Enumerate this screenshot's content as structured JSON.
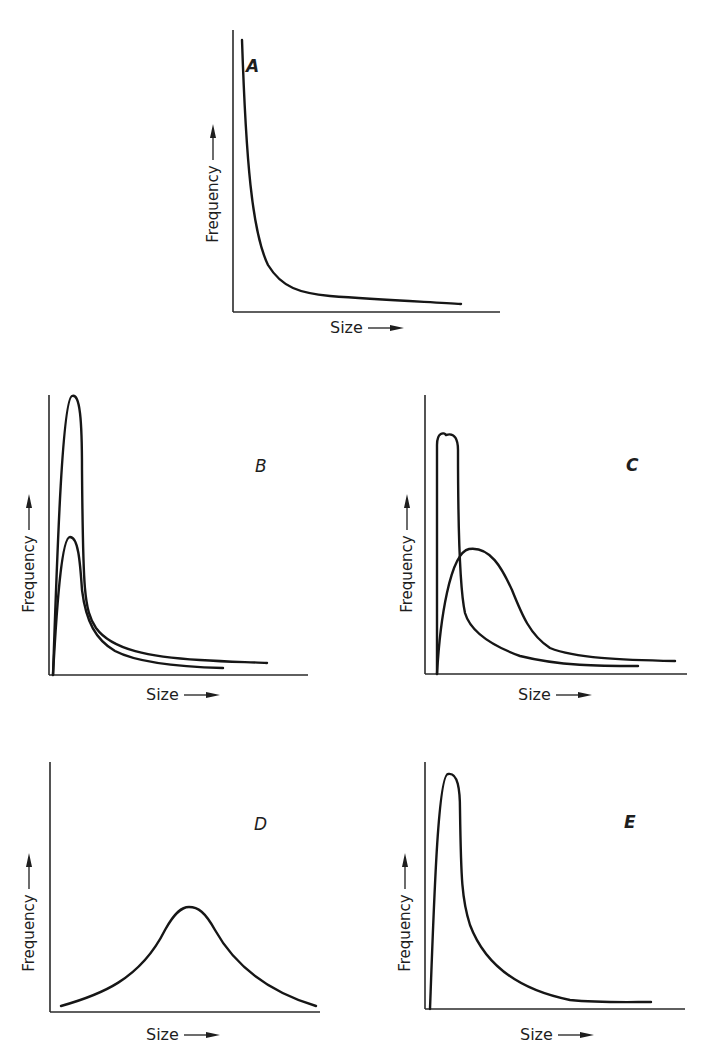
{
  "figure": {
    "width": 710,
    "height": 1057,
    "ink_color": "#161616"
  },
  "chart_data": [
    {
      "id": "A",
      "type": "line",
      "title": "A",
      "xlabel": "Size",
      "ylabel": "Frequency",
      "axis_arrows": true,
      "ticks": false,
      "grid": false,
      "frame": {
        "x0": 233,
        "y0": 312,
        "x1": 500,
        "ytop": 30
      },
      "label_pos": {
        "letter": [
          246,
          72
        ],
        "xlabel": [
          330,
          333
        ],
        "ylabel": [
          218,
          166
        ]
      },
      "letter_bold": true,
      "series": [
        {
          "name": "curve",
          "path": "M242,40 C246,160 252,232 268,265 C282,288 300,293 330,296 C380,300 430,302 461,304"
        }
      ],
      "description": "Monotonically decreasing (reverse-J) distribution: frequency highest at smallest size, decaying rapidly"
    },
    {
      "id": "B",
      "type": "line",
      "title": "B",
      "xlabel": "Size",
      "ylabel": "Frequency",
      "axis_arrows": true,
      "ticks": false,
      "grid": false,
      "frame": {
        "x0": 49,
        "y0": 675,
        "x1": 308,
        "ytop": 395
      },
      "label_pos": {
        "letter": [
          255,
          472
        ],
        "xlabel": [
          146,
          700
        ],
        "ylabel": [
          34,
          536
        ]
      },
      "letter_bold": false,
      "series": [
        {
          "name": "tall-peak",
          "path": "M53,675 C57,560 62,400 72,396 C80,393 82,420 82,470 C83,590 84,610 96,628 C112,650 150,657 200,660 C230,662 250,662 267,663"
        },
        {
          "name": "short-peak",
          "path": "M53,675 C57,600 62,537 70,537 C78,537 80,560 82,590 C86,622 96,640 115,651 C140,664 185,667 223,668"
        }
      ],
      "description": "Two positively skewed curves with same mode position but different peak heights"
    },
    {
      "id": "C",
      "type": "line",
      "title": "C",
      "xlabel": "Size",
      "ylabel": "Frequency",
      "axis_arrows": true,
      "ticks": false,
      "grid": false,
      "frame": {
        "x0": 425,
        "y0": 674,
        "x1": 687,
        "ytop": 395
      },
      "label_pos": {
        "letter": [
          626,
          471
        ],
        "xlabel": [
          518,
          700
        ],
        "ylabel": [
          412,
          536
        ]
      },
      "letter_bold": true,
      "series": [
        {
          "name": "narrow-peak",
          "path": "M437,674 L437,445 C437,432 444,432 446,435 C455,432 458,440 458,450 C458,520 460,590 465,613 C470,630 490,645 520,656 C560,666 600,666 638,666"
        },
        {
          "name": "broad-peak",
          "path": "M437,674 C440,620 450,553 469,549 C490,546 502,568 512,590 C522,615 530,635 550,648 C575,658 620,660 675,661"
        }
      ],
      "description": "A sharp narrow early mode versus a broader, lower, later mode with longer tail"
    },
    {
      "id": "D",
      "type": "line",
      "title": "D",
      "xlabel": "Size",
      "ylabel": "Frequency",
      "axis_arrows": true,
      "ticks": false,
      "grid": false,
      "frame": {
        "x0": 50,
        "y0": 1012,
        "x1": 320,
        "ytop": 762
      },
      "label_pos": {
        "letter": [
          254,
          830
        ],
        "xlabel": [
          146,
          1040
        ],
        "ylabel": [
          34,
          895
        ]
      },
      "letter_bold": false,
      "series": [
        {
          "name": "bell-curve",
          "path": "M61,1006 C100,995 140,980 165,930 C175,912 182,907 189,907 C198,907 205,912 215,930 C240,975 280,995 316,1006"
        }
      ],
      "description": "Symmetric bell-shaped (normal) distribution, mode near middle of size range"
    },
    {
      "id": "E",
      "type": "line",
      "title": "E",
      "xlabel": "Size",
      "ylabel": "Frequency",
      "axis_arrows": true,
      "ticks": false,
      "grid": false,
      "frame": {
        "x0": 425,
        "y0": 1009,
        "x1": 685,
        "ytop": 762
      },
      "label_pos": {
        "letter": [
          624,
          828
        ],
        "xlabel": [
          520,
          1040
        ],
        "ylabel": [
          410,
          895
        ]
      },
      "letter_bold": true,
      "series": [
        {
          "name": "skewed-curve",
          "path": "M430,1009 C434,900 438,775 448,774 C458,772 460,790 460,810 C461,880 462,900 470,925 C485,965 520,990 570,1000 C600,1003 630,1002 651,1002"
        }
      ],
      "description": "Strongly positively skewed (log-normal-like) distribution with sharp early peak and long right tail"
    }
  ]
}
